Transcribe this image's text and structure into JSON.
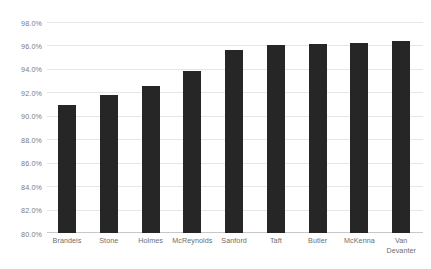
{
  "chart_data": {
    "type": "bar",
    "title": "",
    "subtitle": "",
    "xlabel": "",
    "ylabel": "",
    "categories": [
      "Brandeis",
      "Stone",
      "Holmes",
      "McReynolds",
      "Sanford",
      "Taft",
      "Butler",
      "McKenna",
      "Van Devanter"
    ],
    "category_lines": [
      [
        "Brandeis"
      ],
      [
        "Stone"
      ],
      [
        "Holmes"
      ],
      [
        "McReynolds"
      ],
      [
        "Sanford"
      ],
      [
        "Taft"
      ],
      [
        "Butler"
      ],
      [
        "McKenna"
      ],
      [
        "Van",
        "Devanter"
      ]
    ],
    "values": [
      90.9,
      91.8,
      92.5,
      93.8,
      95.6,
      96.0,
      96.15,
      96.2,
      96.35
    ],
    "value_labels": [
      "90.9%",
      "91.8%",
      "92.5%",
      "93.8%",
      "95.6%",
      "96.0%",
      "96.2%",
      "96.2%",
      "96.4%"
    ],
    "ylim": [
      80.0,
      98.0
    ],
    "ytick_values": [
      98.0,
      96.0,
      94.0,
      92.0,
      90.0,
      88.0,
      86.0,
      84.0,
      82.0,
      80.0
    ],
    "ytick_labels": [
      "98.0%",
      "96.0%",
      "94.0%",
      "92.0%",
      "90.0%",
      "88.0%",
      "86.0%",
      "84.0%",
      "82.0%",
      "80.0%"
    ],
    "grid": true,
    "grid_axis": "y",
    "legend": false,
    "legend_position": "none",
    "series": [
      {
        "name": "",
        "values": [
          90.9,
          91.8,
          92.5,
          93.8,
          95.6,
          96.0,
          96.15,
          96.2,
          96.35
        ]
      }
    ],
    "colors": {
      "bar": "#262626",
      "gridline": "#e6e6e6",
      "axis": "#c8c8c8",
      "tick_text": "#7a7a7a",
      "background": "#ffffff"
    }
  }
}
